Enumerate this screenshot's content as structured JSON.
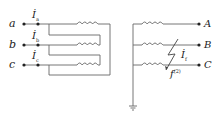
{
  "diagram": {
    "type": "transformer-circuit",
    "left_terminals": [
      {
        "label": "a",
        "current": "İ",
        "current_sub": "a"
      },
      {
        "label": "b",
        "current": "İ",
        "current_sub": "b"
      },
      {
        "label": "c",
        "current": "İ",
        "current_sub": "c"
      }
    ],
    "right_terminals": [
      {
        "label": "A"
      },
      {
        "label": "B"
      },
      {
        "label": "C"
      }
    ],
    "fault": {
      "current": "İ",
      "current_sub": "f",
      "symbol": "f",
      "symbol_sup": "(2)"
    },
    "colors": {
      "line": "#666666",
      "text": "#222222"
    }
  }
}
